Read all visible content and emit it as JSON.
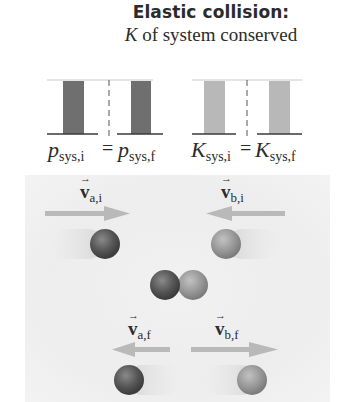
{
  "title": "Elastic collision:",
  "subtitle": {
    "symbol": "K",
    "text": " of system conserved"
  },
  "bar_charts": {
    "momentum": {
      "left_label": {
        "main": "p",
        "sub": "sys,i"
      },
      "right_label": {
        "main": "p",
        "sub": "sys,f"
      },
      "equals": "=",
      "bar_color": "#6f6f6f"
    },
    "kinetic_energy": {
      "left_label": {
        "main": "K",
        "sub": "sys,i"
      },
      "right_label": {
        "main": "K",
        "sub": "sys,f"
      },
      "equals": "=",
      "bar_color": "#b8b8b8"
    }
  },
  "collision_scene": {
    "before": {
      "va": {
        "symbol": "v",
        "sub": "a,i",
        "direction": "right"
      },
      "vb": {
        "symbol": "v",
        "sub": "b,i",
        "direction": "left"
      }
    },
    "after": {
      "va": {
        "symbol": "v",
        "sub": "a,f",
        "direction": "left"
      },
      "vb": {
        "symbol": "v",
        "sub": "b,f",
        "direction": "right"
      }
    },
    "arrow_glyph": "→",
    "ball_a_color": "#5a5a5a",
    "ball_b_color": "#9a9a9a",
    "arrow_color": "#b5b5b5"
  }
}
